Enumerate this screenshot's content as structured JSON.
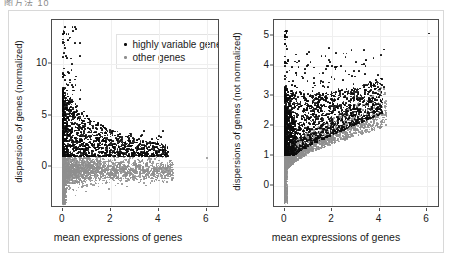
{
  "clipped_header": {
    "text": "图方法 10"
  },
  "legend": {
    "position": "top-left-inside-left-panel",
    "entries": [
      {
        "label": "highly variable genes",
        "color": "#0b0b0b",
        "key": "highly_variable"
      },
      {
        "label": "other genes",
        "color": "#8e8e8e",
        "key": "other"
      }
    ]
  },
  "chart_data": [
    {
      "id": "left",
      "type": "scatter",
      "title": "",
      "xlabel": "mean expressions of genes",
      "ylabel": "dispersions of genes (normalized)",
      "xlim": [
        -0.45,
        6.55
      ],
      "ylim": [
        -3.9,
        14.2
      ],
      "xticks": [
        0,
        2,
        4,
        6
      ],
      "yticks": [
        0,
        5,
        10
      ],
      "grid": true,
      "legend_position": "top-left",
      "series": [
        {
          "name": "highly variable genes",
          "color": "#0b0b0b",
          "n_points": 1400
        },
        {
          "name": "other genes",
          "color": "#8e8e8e",
          "n_points": 2600
        }
      ],
      "notes": "Black highly-variable points form a wedge densest near x=0 decaying toward x~4.5; gray other-genes form a dense horizontal band around y=0 with a thin vertical spike at x=0 down to y=-3.5; one isolated gray point near x=6, y=0.9"
    },
    {
      "id": "right",
      "type": "scatter",
      "title": "",
      "xlabel": "mean expressions of genes",
      "ylabel": "dispersions of genes (not normalized)",
      "xlim": [
        -0.45,
        6.55
      ],
      "ylim": [
        -0.75,
        5.55
      ],
      "xticks": [
        0,
        2,
        4,
        6
      ],
      "yticks": [
        0,
        1,
        2,
        3,
        4,
        5
      ],
      "grid": true,
      "legend_position": "none",
      "series": [
        {
          "name": "highly variable genes",
          "color": "#0b0b0b",
          "n_points": 1500
        },
        {
          "name": "other genes",
          "color": "#8e8e8e",
          "n_points": 2600
        }
      ],
      "notes": "Black points spread broadly in x up to ~4.2 rising to y~4.6; gray points hug a curve that dips from y=1 at x=0 and rises toward y~2.5 at x=4; thin gray vertical spike at x=0 down to y=-0.6; isolated black point near x=6.1, y=5.1"
    }
  ]
}
